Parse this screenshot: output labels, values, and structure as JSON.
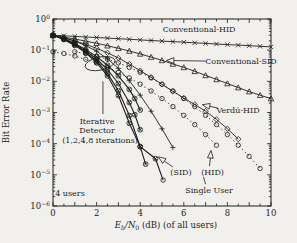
{
  "figure": {
    "background": "#f1f0ec",
    "ink": "#1d1d1d",
    "note": "4 users"
  },
  "chart_data": {
    "type": "line",
    "title": "",
    "xlabel_rich": [
      {
        "t": "E",
        "italic": true
      },
      {
        "t": "b",
        "sub": true,
        "italic": true
      },
      {
        "t": "/N",
        "italic": true
      },
      {
        "t": "0",
        "sub": true
      },
      {
        "t": " (dB) (of all users)"
      }
    ],
    "ylabel": "Bit Error Rate",
    "xlim": [
      0,
      10
    ],
    "x_major_tick_labels": [
      0,
      2,
      4,
      6,
      8,
      10
    ],
    "x_minor_step": 0.5,
    "y_log_exponents": [
      0,
      -1,
      -2,
      -3,
      -4,
      -5,
      -6
    ],
    "legend_position": "none",
    "grid": false,
    "series": [
      {
        "name": "conventional-hid",
        "label": "Conventional-HID",
        "marker": "x",
        "dash": "",
        "width": 0.9,
        "points": [
          [
            0,
            0.302
          ],
          [
            0.5,
            0.289
          ],
          [
            1,
            0.277
          ],
          [
            1.5,
            0.265
          ],
          [
            2,
            0.254
          ],
          [
            2.5,
            0.243
          ],
          [
            3,
            0.233
          ],
          [
            3.5,
            0.223
          ],
          [
            4,
            0.214
          ],
          [
            4.5,
            0.205
          ],
          [
            5,
            0.196
          ],
          [
            5.5,
            0.188
          ],
          [
            6,
            0.18
          ],
          [
            6.5,
            0.172
          ],
          [
            7,
            0.165
          ],
          [
            7.5,
            0.158
          ],
          [
            8,
            0.151
          ],
          [
            8.5,
            0.145
          ],
          [
            9,
            0.139
          ],
          [
            9.5,
            0.133
          ],
          [
            10,
            0.127
          ]
        ]
      },
      {
        "name": "conventional-sid",
        "label": "Conventional-SID",
        "marker": "triangle",
        "dash": "",
        "width": 0.9,
        "points": [
          [
            0,
            0.298
          ],
          [
            0.5,
            0.262
          ],
          [
            1,
            0.228
          ],
          [
            1.5,
            0.196
          ],
          [
            2,
            0.166
          ],
          [
            2.5,
            0.139
          ],
          [
            3,
            0.115
          ],
          [
            3.5,
            0.094
          ],
          [
            4,
            0.076
          ],
          [
            4.5,
            0.06
          ],
          [
            5,
            0.047
          ],
          [
            5.5,
            0.036
          ],
          [
            6,
            0.028
          ],
          [
            6.5,
            0.021
          ],
          [
            7,
            0.0155
          ],
          [
            7.5,
            0.0115
          ],
          [
            8,
            0.0085
          ],
          [
            8.5,
            0.0063
          ],
          [
            9,
            0.0047
          ],
          [
            9.5,
            0.0036
          ],
          [
            10,
            0.0028
          ]
        ]
      },
      {
        "name": "verdu-hid",
        "label": "Verdú-HID",
        "marker": "diamond",
        "dash": "",
        "width": 0.9,
        "points": [
          [
            0,
            0.29
          ],
          [
            0.5,
            0.245
          ],
          [
            1,
            0.198
          ],
          [
            1.5,
            0.154
          ],
          [
            2,
            0.115
          ],
          [
            2.5,
            0.082
          ],
          [
            3,
            0.056
          ],
          [
            3.5,
            0.036
          ],
          [
            4,
            0.022
          ],
          [
            4.5,
            0.0135
          ],
          [
            5,
            0.008
          ],
          [
            5.5,
            0.0048
          ],
          [
            6,
            0.0029
          ],
          [
            6.5,
            0.0018
          ],
          [
            7,
            0.0011
          ],
          [
            7.5,
            0.0006
          ],
          [
            8,
            0.0003
          ],
          [
            8.5,
            0.00014
          ]
        ]
      },
      {
        "name": "unlabeled-plus-curve",
        "label": "",
        "marker": "plus",
        "dash": "",
        "width": 0.9,
        "points": [
          [
            0,
            0.295
          ],
          [
            0.5,
            0.25
          ],
          [
            1,
            0.195
          ],
          [
            1.5,
            0.14
          ],
          [
            2,
            0.092
          ],
          [
            2.5,
            0.053
          ],
          [
            3,
            0.026
          ],
          [
            3.5,
            0.0105
          ],
          [
            4,
            0.0036
          ],
          [
            4.5,
            0.0011
          ],
          [
            5,
            0.0003
          ],
          [
            5.5,
            7.5e-05
          ]
        ]
      },
      {
        "name": "iterative-1",
        "label": "Iterative Detector, 1 iteration",
        "marker": "circlex",
        "dash": "",
        "width": 1.1,
        "points": [
          [
            0,
            0.3
          ],
          [
            0.5,
            0.235
          ],
          [
            1,
            0.165
          ],
          [
            1.5,
            0.105
          ],
          [
            2,
            0.062
          ],
          [
            2.5,
            0.033
          ],
          [
            3,
            0.015
          ],
          [
            3.5,
            0.0055
          ],
          [
            3.75,
            0.0028
          ],
          [
            4,
            0.0012
          ]
        ]
      },
      {
        "name": "iterative-2",
        "label": "Iterative Detector, 2 iterations",
        "marker": "circlex",
        "dash": "",
        "width": 1.1,
        "points": [
          [
            0,
            0.3
          ],
          [
            0.5,
            0.23
          ],
          [
            1,
            0.155
          ],
          [
            1.5,
            0.095
          ],
          [
            2,
            0.052
          ],
          [
            2.5,
            0.024
          ],
          [
            3,
            0.0085
          ],
          [
            3.5,
            0.0021
          ],
          [
            3.75,
            0.00085
          ],
          [
            4,
            0.00028
          ]
        ]
      },
      {
        "name": "iterative-4",
        "label": "Iterative Detector, 4 iterations",
        "marker": "circlex",
        "dash": "",
        "width": 1.1,
        "points": [
          [
            0,
            0.3
          ],
          [
            0.5,
            0.225
          ],
          [
            1,
            0.148
          ],
          [
            1.5,
            0.087
          ],
          [
            2,
            0.045
          ],
          [
            2.5,
            0.018
          ],
          [
            3,
            0.005
          ],
          [
            3.5,
            0.0008
          ],
          [
            4,
            8e-05
          ],
          [
            4.25,
            2.2e-05
          ]
        ]
      },
      {
        "name": "iterative-8",
        "label": "Iterative Detector, 8 iterations (SID)",
        "marker": "circlex",
        "dash": "",
        "width": 1.1,
        "end_marker": "circle",
        "points": [
          [
            0,
            0.3
          ],
          [
            0.5,
            0.22
          ],
          [
            1,
            0.142
          ],
          [
            1.5,
            0.082
          ],
          [
            2,
            0.04
          ],
          [
            2.5,
            0.015
          ],
          [
            3,
            0.0035
          ],
          [
            3.5,
            0.00045
          ],
          [
            4,
            8e-05
          ],
          [
            4.7,
            3.3e-05
          ],
          [
            5.05,
            6.8e-06
          ]
        ]
      },
      {
        "name": "hid-dotted",
        "label": "(HID)",
        "marker": "circle",
        "dash": "1.5 2.6",
        "width": 0.8,
        "points": [
          [
            0,
            0.089
          ],
          [
            0.5,
            0.078
          ],
          [
            1,
            0.065
          ],
          [
            1.5,
            0.051
          ],
          [
            2,
            0.039
          ],
          [
            2.5,
            0.028
          ],
          [
            3,
            0.0195
          ],
          [
            3.5,
            0.0129
          ],
          [
            4,
            0.0081
          ],
          [
            4.5,
            0.0049
          ],
          [
            5,
            0.0028
          ],
          [
            5.5,
            0.00155
          ],
          [
            6,
            0.00081
          ],
          [
            6.5,
            0.00041
          ],
          [
            7,
            0.000195
          ],
          [
            7.5,
            8.9e-05
          ]
        ]
      },
      {
        "name": "single-user",
        "label": "Single User",
        "marker": "circle",
        "dash": "1.5 2.6",
        "width": 0.8,
        "points": [
          [
            1,
            0.089
          ],
          [
            1.5,
            0.078
          ],
          [
            2,
            0.065
          ],
          [
            2.5,
            0.051
          ],
          [
            3,
            0.039
          ],
          [
            3.5,
            0.028
          ],
          [
            4,
            0.0195
          ],
          [
            4.5,
            0.0129
          ],
          [
            5,
            0.0081
          ],
          [
            5.5,
            0.0049
          ],
          [
            6,
            0.0028
          ],
          [
            6.5,
            0.00155
          ],
          [
            7,
            0.00081
          ],
          [
            7.5,
            0.00041
          ],
          [
            8,
            0.000195
          ],
          [
            8.5,
            8.9e-05
          ],
          [
            9,
            3.9e-05
          ],
          [
            9.5,
            1.6e-05
          ]
        ]
      }
    ],
    "annotations": [
      {
        "name": "conventional-hid-label",
        "text": "Conventional-HID",
        "x": 6.7,
        "logy": -0.32
      },
      {
        "name": "conventional-sid-label",
        "text": "Conventional-SID",
        "x": 8.62,
        "logy": -1.35,
        "arrow": {
          "x1": 7.0,
          "logy1": -1.35,
          "x2": 5.2,
          "logy2": -1.33
        }
      },
      {
        "name": "verdu-hid-label",
        "text": "Verdú-HID",
        "x": 8.49,
        "logy": -2.92,
        "arrow": {
          "x1": 7.57,
          "logy1": -2.86,
          "x2": 6.85,
          "logy2": -2.75
        }
      },
      {
        "name": "iterative-label-line1",
        "text": "Iterative",
        "x": 2.02,
        "logy": -3.27
      },
      {
        "name": "iterative-label-line2",
        "text": "Detector",
        "x": 2.02,
        "logy": -3.56
      },
      {
        "name": "iterative-label-line3",
        "text": "(1,2,4,8 iterations)",
        "x": 2.16,
        "logy": -3.88
      },
      {
        "name": "sid-label",
        "text": "(SID)",
        "x": 5.87,
        "logy": -4.92,
        "arrow": {
          "x1": 5.5,
          "logy1": -4.75,
          "x2": 4.83,
          "logy2": -4.42
        }
      },
      {
        "name": "hid-label",
        "text": "(HID)",
        "x": 7.32,
        "logy": -4.92,
        "arrow": {
          "x1": 7.18,
          "logy1": -4.72,
          "x2": 7.25,
          "logy2": -4.22
        }
      },
      {
        "name": "single-user-label",
        "text": "Single User",
        "x": 7.16,
        "logy": -5.49
      },
      {
        "name": "users-note",
        "text": "4 users",
        "x": 0.78,
        "logy": -5.58
      }
    ],
    "pointer_lines": [
      {
        "name": "iterative-pointer",
        "x1": 2.29,
        "logy1": -3.05,
        "x2": 2.29,
        "logy2": -2.0
      },
      {
        "name": "single-user-pointer",
        "x1": 7.0,
        "logy1": -5.3,
        "x2": 6.9,
        "logy2": -5.06
      }
    ],
    "ellipse": {
      "name": "iterations-ellipse",
      "cx": 2.16,
      "logcy": -1.43,
      "rx_db": 0.7,
      "ry_dec": 0.21,
      "rotate": -12
    }
  }
}
